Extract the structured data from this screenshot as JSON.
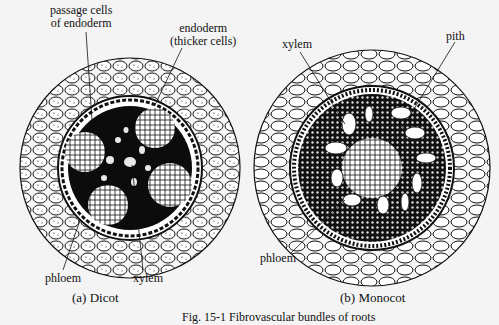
{
  "figure": {
    "caption": "Fig. 15-1 Fibrovascular bundles of roots",
    "panels": [
      {
        "id": "a",
        "label": "(a) Dicot",
        "labels": {
          "passage_cells": "passage cells\nof endoderm",
          "passage_cells_l1": "passage cells",
          "passage_cells_l2": "of endoderm",
          "endoderm_l1": "endoderm",
          "endoderm_l2": "(thicker cells)",
          "phloem": "phloem",
          "xylem": "xylem"
        }
      },
      {
        "id": "b",
        "label": "(b) Monocot",
        "labels": {
          "xylem": "xylem",
          "pith": "pith",
          "phloem": "phloem"
        }
      }
    ]
  }
}
